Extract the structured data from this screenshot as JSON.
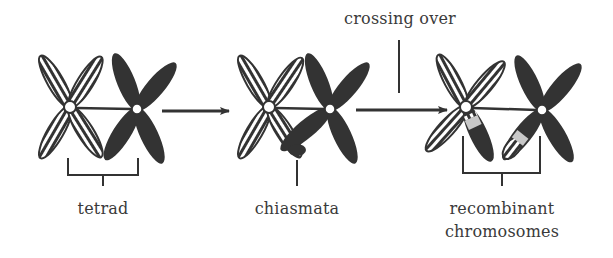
{
  "labels": {
    "tetrad": "tetrad",
    "chiasmata": "chiasmata",
    "crossing_over": "crossing over",
    "recombinant_line1": "recombinant",
    "recombinant_line2": "chromosomes"
  },
  "stages": [
    {
      "id": "tetrad",
      "description": "Homologous chromosome pair (striped and solid) joined as tetrad"
    },
    {
      "id": "chiasmata",
      "description": "Non-sister chromatids cross forming chiasma"
    },
    {
      "id": "recombinant",
      "description": "Segments exchanged producing recombinant chromosomes"
    }
  ],
  "colors": {
    "ink": "#3a3a3a",
    "solid_chromosome": "#333333",
    "exchanged_segment": "#c8c8c8",
    "background": "#ffffff"
  }
}
